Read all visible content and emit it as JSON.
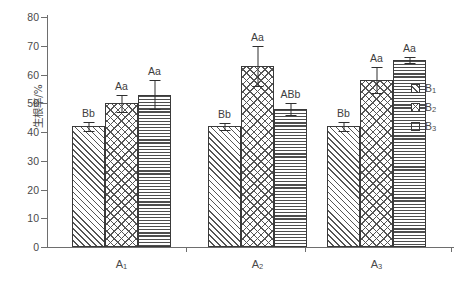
{
  "chart_data": {
    "type": "bar",
    "title": "",
    "subtitle": "",
    "xlabel": "",
    "ylabel": "生根率/%",
    "ylim": [
      0,
      80
    ],
    "ytick_step": 10,
    "yticks": [
      "0",
      "10",
      "20",
      "30",
      "40",
      "50",
      "60",
      "70",
      "80"
    ],
    "grid": false,
    "legend_position": "right",
    "categories": [
      "A₁",
      "A₂",
      "A₃"
    ],
    "category_labels": [
      {
        "base": "A",
        "sub": "1"
      },
      {
        "base": "A",
        "sub": "2"
      },
      {
        "base": "A",
        "sub": "3"
      }
    ],
    "series": [
      {
        "name": "B₁",
        "name_base": "B",
        "name_sub": "1",
        "pattern": "diagonal-hatch",
        "values": [
          42,
          42,
          42
        ],
        "errors": [
          1.5,
          1.2,
          1.5
        ],
        "annotations": [
          "Bb",
          "Bb",
          "Bb"
        ]
      },
      {
        "name": "B₂",
        "name_base": "B",
        "name_sub": "2",
        "pattern": "cross-hatch",
        "values": [
          50,
          63,
          58
        ],
        "errors": [
          3.0,
          7.0,
          4.5
        ],
        "annotations": [
          "Aa",
          "Aa",
          "Aa"
        ]
      },
      {
        "name": "B₃",
        "name_base": "B",
        "name_sub": "3",
        "pattern": "horizontal-lines",
        "values": [
          53,
          48,
          65
        ],
        "errors": [
          5.0,
          2.0,
          1.0
        ],
        "annotations": [
          "Aa",
          "ABb",
          "Aa"
        ]
      }
    ]
  },
  "legend": {
    "items": [
      {
        "label_base": "B",
        "label_sub": "1",
        "pattern": "diagonal-hatch"
      },
      {
        "label_base": "B",
        "label_sub": "2",
        "pattern": "cross-hatch"
      },
      {
        "label_base": "B",
        "label_sub": "3",
        "pattern": "horizontal-lines"
      }
    ]
  },
  "colors": {
    "axis": "#6e6e6e",
    "bar_outline": "#3a3a3a",
    "pattern": "#555555",
    "text": "#4a4a4a",
    "background": "#ffffff"
  }
}
